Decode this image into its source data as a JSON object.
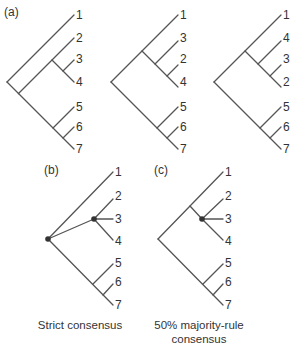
{
  "figure": {
    "panels": [
      {
        "id": "a",
        "label": "(a)",
        "caption": "",
        "trees": [
          {
            "name": "tree-a1",
            "tip_order": [
              "1",
              "2",
              "3",
              "4",
              "5",
              "6",
              "7"
            ],
            "newick": "(1,((2,(3,4)),(5,(6,7))))"
          },
          {
            "name": "tree-a2",
            "tip_order": [
              "1",
              "3",
              "2",
              "4",
              "5",
              "6",
              "7"
            ],
            "newick": "((1,(3,(2,4))),(5,(6,7)))"
          },
          {
            "name": "tree-a3",
            "tip_order": [
              "1",
              "4",
              "3",
              "2",
              "5",
              "6",
              "7"
            ],
            "newick": "((1,(4,(3,2))),(5,(6,7)))"
          }
        ]
      },
      {
        "id": "b",
        "label": "(b)",
        "caption": "Strict consensus",
        "trees": [
          {
            "name": "tree-strict",
            "tip_order": [
              "1",
              "2",
              "3",
              "4",
              "5",
              "6",
              "7"
            ],
            "newick": "(1,(2,3,4),(5,(6,7)))"
          }
        ]
      },
      {
        "id": "c",
        "label": "(c)",
        "caption_line1": "50% majority-rule",
        "caption_line2": "consensus",
        "trees": [
          {
            "name": "tree-majority",
            "tip_order": [
              "1",
              "2",
              "3",
              "4",
              "5",
              "6",
              "7"
            ],
            "newick": "((1,(2,3,4)),(5,(6,7)))"
          }
        ]
      }
    ],
    "tips": {
      "a1": [
        "1",
        "2",
        "3",
        "4",
        "5",
        "6",
        "7"
      ],
      "a2": [
        "1",
        "3",
        "2",
        "4",
        "5",
        "6",
        "7"
      ],
      "a3": [
        "1",
        "4",
        "3",
        "2",
        "5",
        "6",
        "7"
      ],
      "b": [
        "1",
        "2",
        "3",
        "4",
        "5",
        "6",
        "7"
      ],
      "c": [
        "1",
        "2",
        "3",
        "4",
        "5",
        "6",
        "7"
      ]
    },
    "labels": {
      "a": "(a)",
      "b": "(b)",
      "c": "(c)"
    },
    "captions": {
      "b": "Strict consensus",
      "c1": "50% majority-rule",
      "c2": "consensus"
    },
    "colors": {
      "branch": "#555555",
      "text": "#333333",
      "polytomy_node": "#333333"
    }
  }
}
